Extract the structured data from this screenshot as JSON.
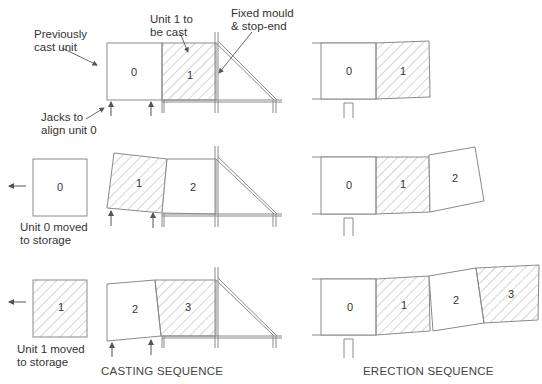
{
  "figure": {
    "sections": [
      {
        "id": "casting",
        "title": "CASTING SEQUENCE"
      },
      {
        "id": "erection",
        "title": "ERECTION SEQUENCE"
      }
    ],
    "annotations": {
      "previously_cast": "Previously\ncast unit",
      "unit1_to_cast": "Unit 1 to\nbe cast",
      "fixed_mould": "Fixed mould\n& stop-end",
      "jacks": "Jacks to\nalign unit 0",
      "unit0_storage": "Unit 0 moved\nto storage",
      "unit1_storage": "Unit 1 moved\nto storage"
    },
    "rows": [
      {
        "step": 1,
        "casting_units": [
          {
            "label": "0",
            "hatched": false
          },
          {
            "label": "1",
            "hatched": true
          }
        ],
        "erection_units": [
          {
            "label": "0",
            "hatched": false
          },
          {
            "label": "1",
            "hatched": true
          }
        ]
      },
      {
        "step": 2,
        "storage_unit": {
          "label": "0",
          "hatched": false
        },
        "casting_units": [
          {
            "label": "1",
            "hatched": true
          },
          {
            "label": "2",
            "hatched": false
          }
        ],
        "erection_units": [
          {
            "label": "0",
            "hatched": false
          },
          {
            "label": "1",
            "hatched": true
          },
          {
            "label": "2",
            "hatched": false
          }
        ]
      },
      {
        "step": 3,
        "storage_unit": {
          "label": "1",
          "hatched": true
        },
        "casting_units": [
          {
            "label": "2",
            "hatched": false
          },
          {
            "label": "3",
            "hatched": true
          }
        ],
        "erection_units": [
          {
            "label": "0",
            "hatched": false
          },
          {
            "label": "1",
            "hatched": true
          },
          {
            "label": "2",
            "hatched": false
          },
          {
            "label": "3",
            "hatched": true
          }
        ]
      }
    ],
    "colors": {
      "line": "#8a8a8a",
      "hatch": "#9a9a9a",
      "text": "#333333"
    }
  }
}
